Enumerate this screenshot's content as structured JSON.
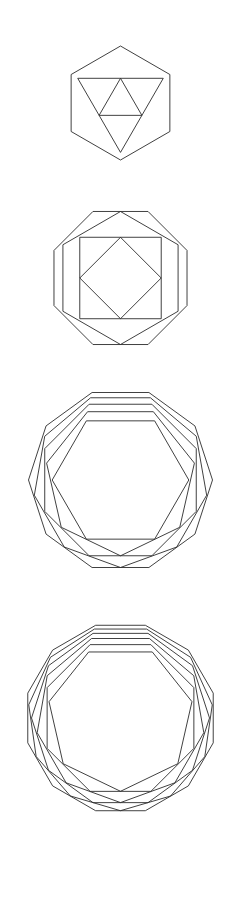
{
  "page": {
    "background_color": "#ffffff",
    "stroke_color": "#2b2b2b",
    "stroke_width": 0.9,
    "width": 241,
    "height": 919,
    "figure_count": 4
  },
  "chart_data": {
    "type": "line",
    "subtitle": "Four stacked line-drawings of regular polygons successively inscribed in one another",
    "xlabel": "",
    "ylabel": "",
    "grid": false,
    "legend": "none",
    "annotations": [],
    "figures": [
      {
        "index": 1,
        "name": "hexagon-triangle-nest",
        "center_x": 120,
        "center_y": 103,
        "outer_radius": 57,
        "ring_count": 3,
        "side_counts": [
          6,
          3,
          3
        ],
        "radii": [
          57,
          49.4,
          24.7
        ],
        "rotations_deg": [
          0,
          180,
          0
        ],
        "bounds": {
          "top": 46,
          "bottom": 160,
          "left": 63,
          "right": 177
        }
      },
      {
        "index": 2,
        "name": "octagon-hexagon-square-diamond-nest",
        "center_x": 120,
        "center_y": 278,
        "outer_radius": 72,
        "ring_count": 4,
        "side_counts": [
          8,
          6,
          4,
          4
        ],
        "radii": [
          72,
          66.5,
          57.6,
          40.7
        ],
        "rotations_deg": [
          22.5,
          0,
          45,
          0
        ],
        "bounds": {
          "top": 206,
          "bottom": 350,
          "left": 48,
          "right": 192
        }
      },
      {
        "index": 3,
        "name": "decagon-to-pentagon-nest",
        "center_x": 120,
        "center_y": 480,
        "outer_radius": 92,
        "ring_count": 5,
        "side_counts": [
          10,
          9,
          8,
          7,
          6
        ],
        "radii": [
          92,
          87.5,
          82.0,
          75.8,
          68.3
        ],
        "rotations_deg": [
          18,
          20,
          22.5,
          25.7,
          30
        ],
        "bounds": {
          "top": 388,
          "bottom": 572,
          "left": 28,
          "right": 212
        }
      },
      {
        "index": 4,
        "name": "dodecagon-to-hexagon-nest",
        "center_x": 120,
        "center_y": 718,
        "outer_radius": 96,
        "ring_count": 6,
        "side_counts": [
          12,
          11,
          10,
          9,
          8,
          7
        ],
        "radii": [
          96,
          92.7,
          89.0,
          84.6,
          79.4,
          73.3
        ],
        "rotations_deg": [
          15,
          16.4,
          18,
          20,
          22.5,
          25.7
        ],
        "bounds": {
          "top": 622,
          "bottom": 814,
          "left": 24,
          "right": 216
        }
      }
    ]
  }
}
